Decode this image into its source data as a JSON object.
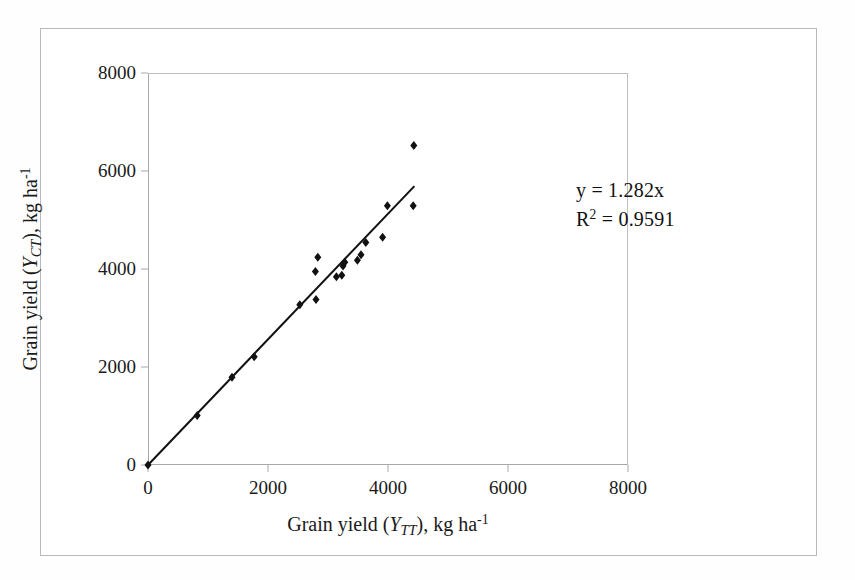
{
  "chart_data": {
    "type": "scatter",
    "title": "",
    "xlabel": "Grain yield (YTT), kg ha-1",
    "ylabel": "Grain yield (YCT), kg ha-1",
    "xlabel_parts": {
      "prefix": "Grain yield (",
      "variable": "Y",
      "subscript": "TT",
      "middle": "), kg ha",
      "superscript": "-1"
    },
    "ylabel_parts": {
      "prefix": "Grain yield (",
      "variable": "Y",
      "subscript": "CT",
      "middle": "), kg ha",
      "superscript": "-1"
    },
    "xlim": [
      0,
      8000
    ],
    "ylim": [
      0,
      8000
    ],
    "xticks": [
      0,
      2000,
      4000,
      6000,
      8000
    ],
    "yticks": [
      0,
      2000,
      4000,
      6000,
      8000
    ],
    "xtick_labels": [
      "0",
      "2000",
      "4000",
      "6000",
      "8000"
    ],
    "ytick_labels": [
      "0",
      "2000",
      "4000",
      "6000",
      "8000"
    ],
    "grid": false,
    "legend": false,
    "marker": "diamond",
    "marker_color": "#111111",
    "marker_size": 9,
    "points": [
      {
        "x": 0,
        "y": 0
      },
      {
        "x": 820,
        "y": 1010
      },
      {
        "x": 1400,
        "y": 1790
      },
      {
        "x": 1770,
        "y": 2210
      },
      {
        "x": 2530,
        "y": 3270
      },
      {
        "x": 2800,
        "y": 3380
      },
      {
        "x": 2790,
        "y": 3950
      },
      {
        "x": 2830,
        "y": 4240
      },
      {
        "x": 3140,
        "y": 3840
      },
      {
        "x": 3230,
        "y": 3870
      },
      {
        "x": 3250,
        "y": 4060
      },
      {
        "x": 3280,
        "y": 4140
      },
      {
        "x": 3490,
        "y": 4180
      },
      {
        "x": 3550,
        "y": 4290
      },
      {
        "x": 3630,
        "y": 4540
      },
      {
        "x": 3910,
        "y": 4650
      },
      {
        "x": 3990,
        "y": 5290
      },
      {
        "x": 4420,
        "y": 5290
      },
      {
        "x": 4430,
        "y": 6520
      }
    ],
    "trendline": {
      "equation_label": "y = 1.282x",
      "r2_label_prefix": "R",
      "r2_label_sup": "2",
      "r2_label_suffix": " = 0.9591",
      "slope": 1.282,
      "intercept": 0,
      "r2": 0.9591,
      "x_start": 0,
      "x_end": 4440,
      "color": "#111111",
      "width": 2
    },
    "annotations": [
      {
        "name": "equation",
        "text": "y = 1.282x"
      },
      {
        "name": "r-squared",
        "text": "R2 = 0.9591"
      }
    ]
  },
  "colors": {
    "background": "#ffffff",
    "axis": "#a8a8a8",
    "frame": "#b9b9b9",
    "marker": "#111111",
    "text": "#1a1a1a"
  }
}
